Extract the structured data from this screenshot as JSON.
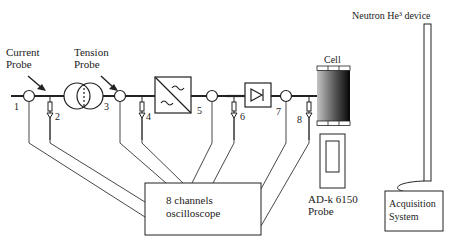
{
  "labels": {
    "current_probe_line1": "Current",
    "current_probe_line2": "Probe",
    "tension_probe_line1": "Tension",
    "tension_probe_line2": "Probe",
    "cell": "Cell",
    "neutron_device": "Neutron He³ device",
    "oscilloscope_line1": "8 channels",
    "oscilloscope_line2": "oscilloscope",
    "adk_line1": "AD-k 6150",
    "adk_line2": "Probe",
    "acq_line1": "Acquisition",
    "acq_line2": "System"
  },
  "points": [
    "1",
    "2",
    "3",
    "4",
    "5",
    "6",
    "7",
    "8"
  ],
  "colors": {
    "stroke": "#222222",
    "cell_dark": "#0a0a0a",
    "cell_light": "#bdbdbd"
  }
}
